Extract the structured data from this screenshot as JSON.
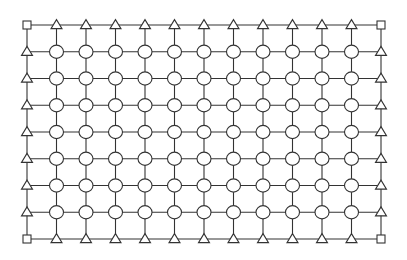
{
  "diagram": {
    "type": "grid-mesh",
    "rows": 9,
    "cols": 13,
    "x_start": 27,
    "x_end": 381,
    "y_start": 25,
    "y_end": 239,
    "colors": {
      "background": "#ffffff",
      "stroke": "#333333",
      "fill": "#ffffff"
    },
    "node_types": {
      "corner": "square",
      "edge": "triangle",
      "interior": "circle"
    },
    "node_sizes": {
      "square": 8,
      "triangle_w": 11,
      "triangle_h": 9,
      "circle_r": 7
    },
    "counts": {
      "squares": 4,
      "triangles": 36,
      "circles": 77
    }
  }
}
